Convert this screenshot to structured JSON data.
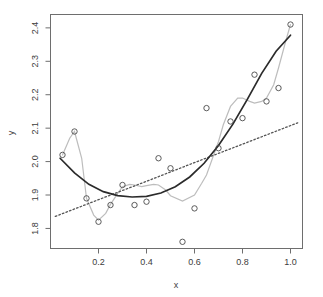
{
  "chart_data": {
    "type": "scatter",
    "title": "",
    "xlabel": "x",
    "ylabel": "y",
    "xlim": [
      0.0,
      1.05
    ],
    "ylim": [
      1.74,
      2.44
    ],
    "grid": false,
    "legend": "none",
    "xticks": [
      "0.2",
      "0.4",
      "0.6",
      "0.8",
      "1.0"
    ],
    "xtick_values": [
      0.2,
      0.4,
      0.6,
      0.8,
      1.0
    ],
    "yticks": [
      "1.8",
      "1.9",
      "2.0",
      "2.1",
      "2.2",
      "2.3",
      "2.4"
    ],
    "ytick_values": [
      1.8,
      1.9,
      2.0,
      2.1,
      2.2,
      2.3,
      2.4
    ],
    "points": {
      "x": [
        0.05,
        0.1,
        0.15,
        0.2,
        0.25,
        0.3,
        0.35,
        0.4,
        0.45,
        0.5,
        0.55,
        0.6,
        0.65,
        0.7,
        0.75,
        0.8,
        0.85,
        0.9,
        0.95,
        1.0
      ],
      "y": [
        2.02,
        2.09,
        1.89,
        1.82,
        1.87,
        1.93,
        1.87,
        1.88,
        2.01,
        1.98,
        1.76,
        1.86,
        2.16,
        2.04,
        2.12,
        2.13,
        2.26,
        2.18,
        2.22,
        2.41
      ]
    },
    "series": [
      {
        "name": "linear-fit",
        "style": "dotted",
        "color": "#555555",
        "x": [
          0.02,
          0.2,
          0.4,
          0.6,
          0.8,
          1.03
        ],
        "y": [
          1.836,
          1.886,
          1.941,
          1.997,
          2.052,
          2.116
        ]
      },
      {
        "name": "quadratic-fit",
        "style": "solid",
        "color": "#2b2b2b",
        "x": [
          0.04,
          0.1,
          0.16,
          0.22,
          0.28,
          0.34,
          0.4,
          0.46,
          0.52,
          0.58,
          0.64,
          0.7,
          0.76,
          0.82,
          0.88,
          0.94,
          1.0
        ],
        "y": [
          2.01,
          1.966,
          1.932,
          1.91,
          1.898,
          1.894,
          1.896,
          1.906,
          1.925,
          1.954,
          1.995,
          2.048,
          2.112,
          2.186,
          2.264,
          2.33,
          2.378
        ]
      },
      {
        "name": "spline-fit",
        "style": "solid",
        "color": "#bdbdbd",
        "x": [
          0.05,
          0.08,
          0.1,
          0.13,
          0.15,
          0.18,
          0.2,
          0.23,
          0.25,
          0.28,
          0.3,
          0.33,
          0.35,
          0.38,
          0.4,
          0.43,
          0.45,
          0.48,
          0.5,
          0.55,
          0.6,
          0.63,
          0.65,
          0.7,
          0.72,
          0.75,
          0.78,
          0.8,
          0.83,
          0.85,
          0.88,
          0.9,
          0.93,
          0.95,
          0.98,
          1.0
        ],
        "y": [
          2.02,
          2.07,
          2.09,
          2.01,
          1.89,
          1.84,
          1.825,
          1.845,
          1.872,
          1.905,
          1.925,
          1.932,
          1.93,
          1.925,
          1.928,
          1.932,
          1.93,
          1.915,
          1.898,
          1.882,
          1.9,
          1.935,
          1.96,
          2.06,
          2.11,
          2.165,
          2.19,
          2.19,
          2.18,
          2.175,
          2.18,
          2.19,
          2.23,
          2.28,
          2.36,
          2.41
        ]
      }
    ]
  }
}
